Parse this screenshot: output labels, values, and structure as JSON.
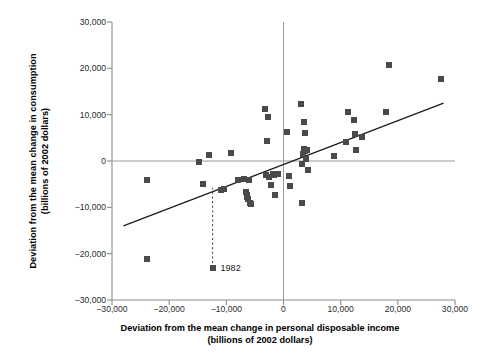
{
  "chart_data": {
    "type": "scatter",
    "title": "",
    "xlabel": "Deviation from the mean change in personal disposable income (billions of 2002 dollars)",
    "xlabel_line1": "Deviation from the mean change in personal disposable income",
    "xlabel_line2": "(billions of 2002 dollars)",
    "ylabel": "Deviation from the mean change in consumption (billions of 2002 dollars)",
    "ylabel_line1": "Deviation from the mean change in consumption",
    "ylabel_line2": "(billions of 2002 dollars)",
    "xlim": [
      -30000,
      30000
    ],
    "ylim": [
      -30000,
      30000
    ],
    "xticks": [
      -30000,
      -20000,
      -10000,
      0,
      10000,
      20000,
      30000
    ],
    "yticks": [
      -30000,
      -20000,
      -10000,
      0,
      10000,
      20000,
      30000
    ],
    "xticklabels": [
      "-30,000",
      "-20,000",
      "-10,000",
      "0",
      "10,000",
      "20,000",
      "30,000"
    ],
    "yticklabels": [
      "-30,000",
      "-20,000",
      "-10,000",
      "0",
      "10,000",
      "20,000",
      "30,000"
    ],
    "grid": false,
    "zero_lines": true,
    "legend": null,
    "marker_color": "#4a4a4a",
    "line_color": "#1a1a1a",
    "axis_color": "#8c8c8c",
    "points": [
      [
        -23900,
        -4000
      ],
      [
        -23800,
        -21100
      ],
      [
        -14700,
        -300
      ],
      [
        -14100,
        -5000
      ],
      [
        -13000,
        1400
      ],
      [
        -12400,
        -23000
      ],
      [
        -10900,
        -6200
      ],
      [
        -10400,
        -6100
      ],
      [
        -9200,
        1700
      ],
      [
        -7900,
        -4200
      ],
      [
        -6900,
        -3900
      ],
      [
        -6500,
        -6600
      ],
      [
        -6400,
        -7300
      ],
      [
        -6300,
        -7700
      ],
      [
        -6200,
        -8200
      ],
      [
        -6100,
        -4000
      ],
      [
        -5900,
        -9000
      ],
      [
        -5700,
        -9200
      ],
      [
        -3200,
        11200
      ],
      [
        -3100,
        -3100
      ],
      [
        -2900,
        4400
      ],
      [
        -2700,
        9600
      ],
      [
        -2500,
        -3500
      ],
      [
        -2100,
        -5100
      ],
      [
        -1900,
        -2900
      ],
      [
        -1600,
        -3000
      ],
      [
        -1400,
        -7300
      ],
      [
        -1000,
        -2900
      ],
      [
        600,
        6300
      ],
      [
        900,
        -3300
      ],
      [
        1100,
        -5500
      ],
      [
        3100,
        12200
      ],
      [
        3200,
        -9100
      ],
      [
        3300,
        -600
      ],
      [
        3400,
        1600
      ],
      [
        3500,
        8400
      ],
      [
        3600,
        2600
      ],
      [
        3700,
        2100
      ],
      [
        3800,
        6000
      ],
      [
        3900,
        500
      ],
      [
        4100,
        2400
      ],
      [
        4300,
        -2000
      ],
      [
        8900,
        1000
      ],
      [
        11000,
        4200
      ],
      [
        11300,
        10600
      ],
      [
        12400,
        8800
      ],
      [
        12500,
        5900
      ],
      [
        12700,
        2400
      ],
      [
        13700,
        5200
      ],
      [
        17900,
        10500
      ],
      [
        18500,
        20700
      ],
      [
        27600,
        17600
      ]
    ],
    "trendline": {
      "x1": -28000,
      "y1": -14000,
      "x2": 28000,
      "y2": 12500
    },
    "annotation": {
      "label": "1982",
      "point_x": -12400,
      "point_y": -23000,
      "dashed_line_top_y": -5800
    }
  }
}
